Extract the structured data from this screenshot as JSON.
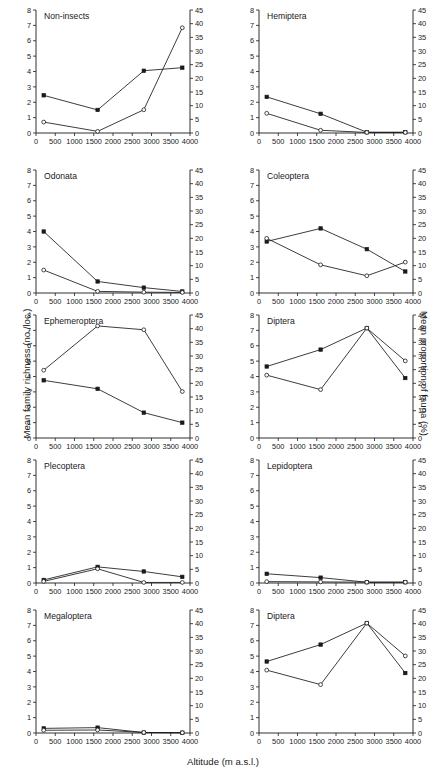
{
  "figure": {
    "xlabel": "Altitude (m a.s.l.)",
    "ylabel_left": "Mean family richness (no./loc.)",
    "ylabel_right": "Mean proportion of fauna (%)",
    "x_ticks": [
      0,
      500,
      1000,
      1500,
      2000,
      2500,
      3000,
      3500,
      4000
    ],
    "x_tick_labels": [
      "0",
      "500",
      "1000",
      "1500",
      "2000",
      "2500",
      "3000",
      "3500",
      "4000"
    ],
    "y_left_ticks": [
      0,
      1,
      2,
      3,
      4,
      5,
      6,
      7,
      8
    ],
    "y_left_tick_labels": [
      "0",
      "1",
      "2",
      "3",
      "4",
      "5",
      "6",
      "7",
      "8"
    ],
    "y_right_ticks": [
      0,
      5,
      10,
      15,
      20,
      25,
      30,
      35,
      40,
      45
    ],
    "y_right_tick_labels": [
      "0",
      "5",
      "10",
      "15",
      "20",
      "25",
      "30",
      "35",
      "40",
      "45"
    ],
    "xlim": [
      0,
      4000
    ],
    "ylim_left": [
      0,
      8
    ],
    "ylim_right": [
      0,
      45
    ],
    "series_names": [
      "Mean family richness (no./loc.)",
      "Mean proportion of fauna (%)"
    ],
    "marker_richness": "filled-square",
    "marker_proportion": "open-circle",
    "line_color": "#1a1a1a"
  },
  "chart_data": [
    {
      "type": "line",
      "title": "Non-insects",
      "panel": 0,
      "xlabel": "Altitude (m a.s.l.)",
      "ylabel": "Mean family richness (no./loc.)",
      "xlim": [
        0,
        4000
      ],
      "ylim": [
        0,
        8
      ],
      "ylim_right": [
        0,
        45
      ],
      "grid": false,
      "x": [
        200,
        1600,
        2800,
        3800
      ],
      "series": [
        {
          "name": "Mean family richness (no./loc.)",
          "axis": "left",
          "marker": "filled-square",
          "values": [
            2.45,
            1.5,
            4.05,
            4.25
          ]
        },
        {
          "name": "Mean proportion of fauna (%)",
          "axis": "right",
          "marker": "open-circle",
          "values": [
            4.0,
            0.6,
            8.5,
            38.5
          ]
        }
      ]
    },
    {
      "type": "line",
      "title": "Hemiptera",
      "panel": 1,
      "xlabel": "Altitude (m a.s.l.)",
      "ylabel": "Mean family richness (no./loc.)",
      "xlim": [
        0,
        4000
      ],
      "ylim": [
        0,
        8
      ],
      "ylim_right": [
        0,
        45
      ],
      "grid": false,
      "x": [
        200,
        1600,
        2800,
        3800
      ],
      "series": [
        {
          "name": "Mean family richness (no./loc.)",
          "axis": "left",
          "marker": "filled-square",
          "values": [
            2.35,
            1.25,
            0.05,
            0.05
          ]
        },
        {
          "name": "Mean proportion of fauna (%)",
          "axis": "right",
          "marker": "open-circle",
          "values": [
            7.2,
            1.0,
            0.2,
            0.2
          ]
        }
      ]
    },
    {
      "type": "line",
      "title": "Odonata",
      "panel": 2,
      "xlabel": "Altitude (m a.s.l.)",
      "ylabel": "Mean family richness (no./loc.)",
      "xlim": [
        0,
        4000
      ],
      "ylim": [
        0,
        8
      ],
      "ylim_right": [
        0,
        45
      ],
      "grid": false,
      "x": [
        200,
        1600,
        2800,
        3800
      ],
      "series": [
        {
          "name": "Mean family richness (no./loc.)",
          "axis": "left",
          "marker": "filled-square",
          "values": [
            4.0,
            0.75,
            0.35,
            0.1
          ]
        },
        {
          "name": "Mean proportion of fauna (%)",
          "axis": "right",
          "marker": "open-circle",
          "values": [
            8.4,
            0.6,
            0.3,
            0.2
          ]
        }
      ]
    },
    {
      "type": "line",
      "title": "Coleoptera",
      "panel": 3,
      "xlabel": "Altitude (m a.s.l.)",
      "ylabel": "Mean family richness (no./loc.)",
      "xlim": [
        0,
        4000
      ],
      "ylim": [
        0,
        8
      ],
      "ylim_right": [
        0,
        45
      ],
      "grid": false,
      "x": [
        200,
        1600,
        2800,
        3800
      ],
      "series": [
        {
          "name": "Mean family richness (no./loc.)",
          "axis": "left",
          "marker": "filled-square",
          "values": [
            3.35,
            4.2,
            2.85,
            1.4
          ]
        },
        {
          "name": "Mean proportion of fauna (%)",
          "axis": "right",
          "marker": "open-circle",
          "values": [
            20.0,
            10.3,
            6.3,
            11.3
          ]
        }
      ]
    },
    {
      "type": "line",
      "title": "Ephemeroptera",
      "panel": 4,
      "xlabel": "Altitude (m a.s.l.)",
      "ylabel": "Mean family richness (no./loc.)",
      "xlim": [
        0,
        4000
      ],
      "ylim": [
        0,
        8
      ],
      "ylim_right": [
        0,
        45
      ],
      "grid": false,
      "x": [
        200,
        1600,
        2800,
        3800
      ],
      "series": [
        {
          "name": "Mean family richness (no./loc.)",
          "axis": "left",
          "marker": "filled-square",
          "values": [
            3.75,
            3.2,
            1.65,
            1.0
          ]
        },
        {
          "name": "Mean proportion of fauna (%)",
          "axis": "right",
          "marker": "open-circle",
          "values": [
            24.8,
            41.0,
            39.6,
            17.0
          ]
        }
      ]
    },
    {
      "type": "line",
      "title": "Diptera",
      "panel": 5,
      "xlabel": "Altitude (m a.s.l.)",
      "ylabel": "Mean family richness (no./loc.)",
      "xlim": [
        0,
        4000
      ],
      "ylim": [
        0,
        8
      ],
      "ylim_right": [
        0,
        45
      ],
      "grid": false,
      "x": [
        200,
        1600,
        2800,
        3800
      ],
      "series": [
        {
          "name": "Mean family richness (no./loc.)",
          "axis": "left",
          "marker": "filled-square",
          "values": [
            4.65,
            5.75,
            7.15,
            3.9
          ]
        },
        {
          "name": "Mean proportion of fauna (%)",
          "axis": "right",
          "marker": "open-circle",
          "values": [
            23.0,
            17.7,
            40.2,
            28.2
          ]
        }
      ]
    },
    {
      "type": "line",
      "title": "Plecoptera",
      "panel": 6,
      "xlabel": "Altitude (m a.s.l.)",
      "ylabel": "Mean family richness (no./loc.)",
      "xlim": [
        0,
        4000
      ],
      "ylim": [
        0,
        8
      ],
      "ylim_right": [
        0,
        45
      ],
      "grid": false,
      "x": [
        200,
        1600,
        2800,
        3800
      ],
      "series": [
        {
          "name": "Mean family richness (no./loc.)",
          "axis": "left",
          "marker": "filled-square",
          "values": [
            0.2,
            1.05,
            0.75,
            0.4
          ]
        },
        {
          "name": "Mean proportion of fauna (%)",
          "axis": "right",
          "marker": "open-circle",
          "values": [
            0.6,
            5.2,
            0.2,
            0.2
          ]
        }
      ]
    },
    {
      "type": "line",
      "title": "Lepidoptera",
      "panel": 7,
      "xlabel": "Altitude (m a.s.l.)",
      "ylabel": "Mean family richness (no./loc.)",
      "xlim": [
        0,
        4000
      ],
      "ylim": [
        0,
        8
      ],
      "ylim_right": [
        0,
        45
      ],
      "grid": false,
      "x": [
        200,
        1600,
        2800,
        3800
      ],
      "series": [
        {
          "name": "Mean family richness (no./loc.)",
          "axis": "left",
          "marker": "filled-square",
          "values": [
            0.6,
            0.35,
            0.05,
            0.05
          ]
        },
        {
          "name": "Mean proportion of fauna (%)",
          "axis": "right",
          "marker": "open-circle",
          "values": [
            0.5,
            0.4,
            0.3,
            0.3
          ]
        }
      ]
    },
    {
      "type": "line",
      "title": "Megaloptera",
      "panel": 8,
      "xlabel": "Altitude (m a.s.l.)",
      "ylabel": "Mean family richness (no./loc.)",
      "xlim": [
        0,
        4000
      ],
      "ylim": [
        0,
        8
      ],
      "ylim_right": [
        0,
        45
      ],
      "grid": false,
      "x": [
        200,
        1600,
        2800,
        3800
      ],
      "series": [
        {
          "name": "Mean family richness (no./loc.)",
          "axis": "left",
          "marker": "filled-square",
          "values": [
            0.3,
            0.35,
            0.03,
            0.02
          ]
        },
        {
          "name": "Mean proportion of fauna (%)",
          "axis": "right",
          "marker": "open-circle",
          "values": [
            1.0,
            1.1,
            0.2,
            0.1
          ]
        }
      ]
    },
    {
      "type": "line",
      "title": "Diptera",
      "panel": 9,
      "xlabel": "Altitude (m a.s.l.)",
      "ylabel": "Mean family richness (no./loc.)",
      "xlim": [
        0,
        4000
      ],
      "ylim": [
        0,
        8
      ],
      "ylim_right": [
        0,
        45
      ],
      "grid": false,
      "x": [
        200,
        1600,
        2800,
        3800
      ],
      "series": [
        {
          "name": "Mean family richness (no./loc.)",
          "axis": "left",
          "marker": "filled-square",
          "values": [
            4.65,
            5.75,
            7.15,
            3.9
          ]
        },
        {
          "name": "Mean proportion of fauna (%)",
          "axis": "right",
          "marker": "open-circle",
          "values": [
            23.0,
            17.7,
            40.2,
            28.2
          ]
        }
      ]
    }
  ]
}
